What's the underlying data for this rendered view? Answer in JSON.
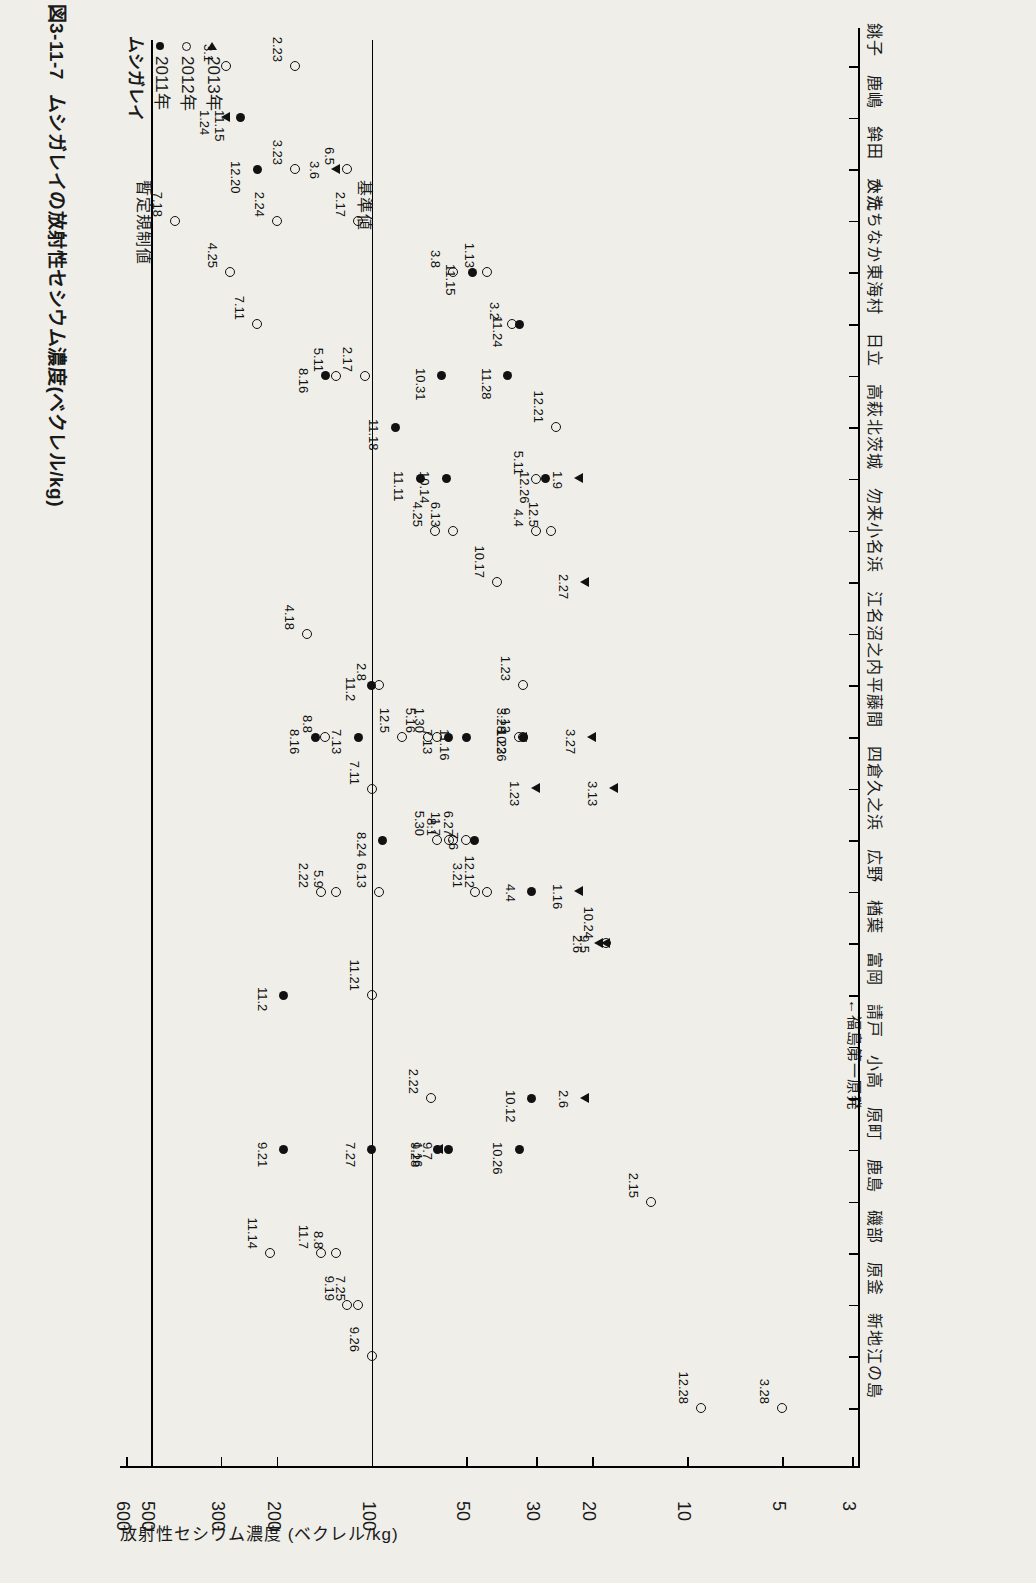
{
  "figure": {
    "number": "図3-11-7",
    "title": "ムシガレイの放射性セシウム濃度(ベクレル/kg)"
  },
  "axis": {
    "value_label": "放射性セシウム濃度 (ベクレル/kg)",
    "ticks": [
      "600",
      "500",
      "300",
      "200",
      "100",
      "50",
      "30",
      "20",
      "10",
      "5",
      "3"
    ]
  },
  "legend": {
    "header": "ムシガレイ",
    "items": [
      {
        "symbol": "filled",
        "label": "2011年"
      },
      {
        "symbol": "open",
        "label": "2012年"
      },
      {
        "symbol": "tri",
        "label": "2013年"
      }
    ]
  },
  "reference_lines": [
    {
      "label": "暫定規制値",
      "value": 500
    },
    {
      "label": "基準値",
      "value": 100
    }
  ],
  "annotations": [
    {
      "name": "fukushima-daiichi",
      "text": "←福島第一原発"
    }
  ],
  "chart_data": {
    "type": "scatter",
    "title": "ムシガレイの放射性セシウム濃度(ベクレル/kg)",
    "xlabel": "",
    "ylabel": "放射性セシウム濃度 (ベクレル/kg)",
    "yscale": "log",
    "ylim": [
      3,
      600
    ],
    "ytick_values": [
      600,
      500,
      300,
      200,
      100,
      50,
      30,
      20,
      10,
      5,
      3
    ],
    "grid": false,
    "legend_position": "top-left",
    "reference_lines": [
      {
        "label": "暫定規制値",
        "value": 500
      },
      {
        "label": "基準値",
        "value": 100
      }
    ],
    "categories": [
      "銚子",
      "鹿嶋",
      "鉾田",
      "大洗",
      "ひたちなか",
      "東海村",
      "日立",
      "高萩",
      "北茨城",
      "勿来",
      "小名浜",
      "江名",
      "沼之内",
      "平藤間",
      "四倉",
      "久之浜",
      "広野",
      "楢葉",
      "富岡",
      "請戸",
      "小高",
      "原町",
      "鹿島",
      "磯部",
      "原釜",
      "新地",
      "江の島"
    ],
    "series": [
      {
        "name": "2011年",
        "symbol": "filled-circle",
        "points": [
          {
            "category": "鹿嶋",
            "value": 260,
            "label": "11.15"
          },
          {
            "category": "鉾田",
            "value": 230,
            "label": "12.20"
          },
          {
            "category": "ひたちなか",
            "value": 48,
            "label": "11.15"
          },
          {
            "category": "東海村",
            "value": 34,
            "label": "11.24"
          },
          {
            "category": "日立",
            "value": 140,
            "label": "8.16"
          },
          {
            "category": "日立",
            "value": 60,
            "label": "10.31"
          },
          {
            "category": "日立",
            "value": 37,
            "label": "11.28"
          },
          {
            "category": "高萩",
            "value": 84,
            "label": "11.18"
          },
          {
            "category": "北茨城",
            "value": 70,
            "label": "11.11"
          },
          {
            "category": "北茨城",
            "value": 58,
            "label": "10.14"
          },
          {
            "category": "北茨城",
            "value": 28,
            "label": "12.26"
          },
          {
            "category": "平藤間",
            "value": 150,
            "label": "8.16"
          },
          {
            "category": "沼之内",
            "value": 100,
            "label": "11.2"
          },
          {
            "category": "平藤間",
            "value": 110,
            "label": "7.13"
          },
          {
            "category": "平藤間",
            "value": 57,
            "label": "7.13"
          },
          {
            "category": "平藤間",
            "value": 50,
            "label": "11.16"
          },
          {
            "category": "平藤間",
            "value": 33,
            "label": "10.26"
          },
          {
            "category": "久之浜",
            "value": 92,
            "label": "8.24"
          },
          {
            "category": "久之浜",
            "value": 47,
            "label": "7.6"
          },
          {
            "category": "広野",
            "value": 31,
            "label": "4.4"
          },
          {
            "category": "小高",
            "value": 31,
            "label": "10.12"
          },
          {
            "category": "富岡",
            "value": 190,
            "label": "11.2"
          },
          {
            "category": "原町",
            "value": 190,
            "label": "9.21"
          },
          {
            "category": "原町",
            "value": 100,
            "label": "7.27"
          },
          {
            "category": "原町",
            "value": 62,
            "label": "9.28"
          },
          {
            "category": "原町",
            "value": 57,
            "label": "9.7"
          },
          {
            "category": "原町",
            "value": 34,
            "label": "10.26"
          }
        ]
      },
      {
        "name": "2012年",
        "symbol": "open-circle",
        "points": [
          {
            "category": "銚子",
            "value": 290,
            "label": "3.1"
          },
          {
            "category": "銚子",
            "value": 175,
            "label": "2.23"
          },
          {
            "category": "鉾田",
            "value": 175,
            "label": "3.23"
          },
          {
            "category": "鉾田",
            "value": 120,
            "label": "6.5"
          },
          {
            "category": "大洗",
            "value": 200,
            "label": "2.24"
          },
          {
            "category": "大洗",
            "value": 110,
            "label": "2.17"
          },
          {
            "category": "ひたちなか",
            "value": 55,
            "label": "3.8"
          },
          {
            "category": "ひたちなか",
            "value": 43,
            "label": "1.13"
          },
          {
            "category": "東海村",
            "value": 36,
            "label": "3.2"
          },
          {
            "category": "日立",
            "value": 105,
            "label": "2.17"
          },
          {
            "category": "日立",
            "value": 130,
            "label": "5.11"
          },
          {
            "category": "高萩",
            "value": 26,
            "label": "12.21"
          },
          {
            "category": "北茨城",
            "value": 30,
            "label": "5.11"
          },
          {
            "category": "勿来",
            "value": 27,
            "label": "12.5"
          },
          {
            "category": "勿来",
            "value": 63,
            "label": "4.25"
          },
          {
            "category": "勿来",
            "value": 55,
            "label": "6.13"
          },
          {
            "category": "勿来",
            "value": 30,
            "label": "4.4"
          },
          {
            "category": "小名浜",
            "value": 40,
            "label": "10.17"
          },
          {
            "category": "江名",
            "value": 160,
            "label": "4.18"
          },
          {
            "category": "沼之内",
            "value": 95,
            "label": "2.8"
          },
          {
            "category": "沼之内",
            "value": 33,
            "label": "1.23"
          },
          {
            "category": "平藤間",
            "value": 140,
            "label": "8.8"
          },
          {
            "category": "平藤間",
            "value": 80,
            "label": "12.5"
          },
          {
            "category": "平藤間",
            "value": 66,
            "label": "5.16"
          },
          {
            "category": "平藤間",
            "value": 62,
            "label": "1.30"
          },
          {
            "category": "平藤間",
            "value": 34,
            "label": "3.28"
          },
          {
            "category": "平藤間",
            "value": 33,
            "label": "9.12"
          },
          {
            "category": "四倉",
            "value": 100,
            "label": "7.11"
          },
          {
            "category": "久之浜",
            "value": 62,
            "label": "5.30"
          },
          {
            "category": "久之浜",
            "value": 57,
            "label": "8.1"
          },
          {
            "category": "久之浜",
            "value": 55,
            "label": "11.7"
          },
          {
            "category": "久之浜",
            "value": 50,
            "label": "6.27"
          },
          {
            "category": "広野",
            "value": 95,
            "label": "6.13"
          },
          {
            "category": "広野",
            "value": 145,
            "label": "2.22"
          },
          {
            "category": "広野",
            "value": 130,
            "label": "5.9"
          },
          {
            "category": "広野",
            "value": 47,
            "label": "3.21"
          },
          {
            "category": "広野",
            "value": 43,
            "label": "12.12"
          },
          {
            "category": "楢葉",
            "value": 18,
            "label": "10.24"
          },
          {
            "category": "富岡",
            "value": 100,
            "label": "11.21"
          },
          {
            "category": "小高",
            "value": 65,
            "label": "2.22"
          },
          {
            "category": "鹿島",
            "value": 13,
            "label": "2.15"
          },
          {
            "category": "磯部",
            "value": 210,
            "label": "11.14"
          },
          {
            "category": "磯部",
            "value": 145,
            "label": "11.7"
          },
          {
            "category": "磯部",
            "value": 130,
            "label": "8.8"
          },
          {
            "category": "原釜",
            "value": 120,
            "label": "9.19"
          },
          {
            "category": "原釜",
            "value": 110,
            "label": "7.25"
          },
          {
            "category": "新地",
            "value": 100,
            "label": "9.26"
          },
          {
            "category": "江の島",
            "value": 9,
            "label": "12.28"
          },
          {
            "category": "江の島",
            "value": 5,
            "label": "3.28"
          },
          {
            "category": "大洗",
            "value": 420,
            "label": "7.18"
          },
          {
            "category": "ひたちなか",
            "value": 280,
            "label": "4.25"
          },
          {
            "category": "東海村",
            "value": 230,
            "label": "7.11"
          }
        ]
      },
      {
        "name": "2013年",
        "symbol": "triangle",
        "points": [
          {
            "category": "鹿嶋",
            "value": 290,
            "label": "1.24"
          },
          {
            "category": "鉾田",
            "value": 130,
            "label": "3.6"
          },
          {
            "category": "北茨城",
            "value": 22,
            "label": "1.9"
          },
          {
            "category": "小名浜",
            "value": 21,
            "label": "2.27"
          },
          {
            "category": "平藤間",
            "value": 20,
            "label": "3.27"
          },
          {
            "category": "平藤間",
            "value": 33,
            "label": "1.23"
          },
          {
            "category": "四倉",
            "value": 30,
            "label": "1.23"
          },
          {
            "category": "四倉",
            "value": 17,
            "label": "3.13"
          },
          {
            "category": "広野",
            "value": 22,
            "label": "1.16"
          },
          {
            "category": "楢葉",
            "value": 19,
            "label": "2.6"
          },
          {
            "category": "楢葉",
            "value": 18,
            "label": "9.5"
          },
          {
            "category": "小高",
            "value": 21,
            "label": "2.6"
          },
          {
            "category": "原町",
            "value": 61,
            "label": "1.16"
          }
        ]
      }
    ]
  }
}
